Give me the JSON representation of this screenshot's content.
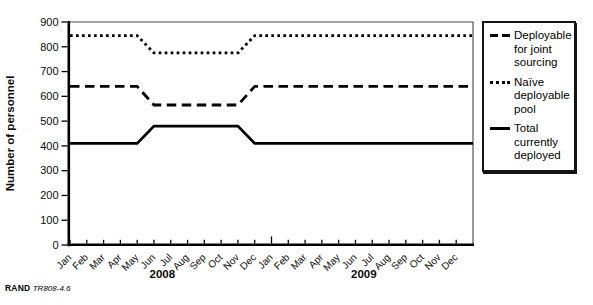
{
  "figure": {
    "caption_brand": "RAND",
    "caption_id": "TR808-4.6"
  },
  "legend": {
    "entries": [
      {
        "style": "dashed",
        "label": "Deployable\nfor joint\nsourcing"
      },
      {
        "style": "dotted",
        "label": "Naïve\ndeployable\npool"
      },
      {
        "style": "solid",
        "label": "Total\ncurrently\ndeployed"
      }
    ]
  },
  "chart_data": {
    "type": "line",
    "title": "",
    "xlabel": "",
    "ylabel": "Number of personnel",
    "ylim": [
      0,
      900
    ],
    "ytick_interval": 100,
    "grid": false,
    "legend_position": "right",
    "x_tick_rotation": 45,
    "years": [
      "2008",
      "2009"
    ],
    "categories": [
      "Jan",
      "Feb",
      "Mar",
      "Apr",
      "May",
      "Jun",
      "Jul",
      "Aug",
      "Sep",
      "Oct",
      "Nov",
      "Dec",
      "Jan",
      "Feb",
      "Mar",
      "Apr",
      "May",
      "Jun",
      "Jul",
      "Aug",
      "Sep",
      "Oct",
      "Nov",
      "Dec"
    ],
    "series": [
      {
        "name": "Deployable for joint sourcing",
        "line_style": "dashed",
        "color": "#000000",
        "values": [
          640,
          640,
          640,
          640,
          640,
          565,
          565,
          565,
          565,
          565,
          565,
          640,
          640,
          640,
          640,
          640,
          640,
          640,
          640,
          640,
          640,
          640,
          640,
          640
        ]
      },
      {
        "name": "Naïve deployable pool",
        "line_style": "dotted",
        "color": "#000000",
        "values": [
          845,
          845,
          845,
          845,
          845,
          775,
          775,
          775,
          775,
          775,
          775,
          845,
          845,
          845,
          845,
          845,
          845,
          845,
          845,
          845,
          845,
          845,
          845,
          845
        ]
      },
      {
        "name": "Total currently deployed",
        "line_style": "solid",
        "color": "#000000",
        "values": [
          410,
          410,
          410,
          410,
          410,
          480,
          480,
          480,
          480,
          480,
          480,
          410,
          410,
          410,
          410,
          410,
          410,
          410,
          410,
          410,
          410,
          410,
          410,
          410
        ]
      }
    ],
    "frame_colors": {
      "axis": "#000000",
      "top": "#a3a3a3",
      "right": "#6b6b6b"
    }
  }
}
